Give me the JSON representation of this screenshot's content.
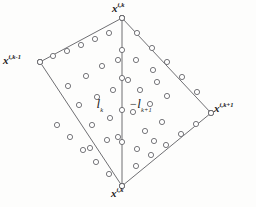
{
  "figure": {
    "kind": "geometric-diagram",
    "background_color": "#fdfdfc",
    "stroke_color": "#5f5f63",
    "node_fill_color": "#ffffff",
    "text_color": "#1b1b1b",
    "width": 256,
    "height": 207
  },
  "vertices": {
    "top": {
      "base": "x",
      "superscript": "i,k",
      "x": 122,
      "y": 18
    },
    "left": {
      "base": "x",
      "superscript": "i,k-1",
      "x": 40,
      "y": 62
    },
    "right": {
      "base": "x",
      "superscript": "i,k+1",
      "x": 211,
      "y": 113
    },
    "bottom": {
      "base": "x",
      "superscript": "i,k",
      "x": 122,
      "y": 186
    }
  },
  "regions": {
    "left_region": {
      "sign": "",
      "base": "l",
      "subscript": "k",
      "x": 103,
      "y": 104
    },
    "right_region": {
      "sign": "−",
      "base": "l",
      "subscript": "k+1",
      "x": 146,
      "y": 104
    }
  },
  "edges": [
    {
      "name": "edge-left-to-top",
      "from": "left",
      "to": "top"
    },
    {
      "name": "edge-top-to-right",
      "from": "top",
      "to": "right"
    },
    {
      "name": "edge-right-to-bottom",
      "from": "right",
      "to": "bottom"
    },
    {
      "name": "edge-bottom-to-left",
      "from": "bottom",
      "to": "left"
    },
    {
      "name": "edge-median-top-bottom",
      "from": "top",
      "to": "bottom"
    }
  ],
  "edge_nodes": {
    "left_to_top": [
      [
        40,
        62
      ],
      [
        53,
        56
      ],
      [
        67,
        51
      ],
      [
        81,
        45
      ],
      [
        95,
        39
      ],
      [
        109,
        33
      ],
      [
        122,
        18
      ]
    ],
    "top_to_right": [
      [
        122,
        18
      ],
      [
        137,
        33
      ],
      [
        152,
        48
      ],
      [
        167,
        62
      ],
      [
        182,
        77
      ],
      [
        197,
        92
      ],
      [
        211,
        113
      ]
    ],
    "right_to_bottom": [
      [
        211,
        113
      ],
      [
        196,
        124
      ],
      [
        181,
        134
      ],
      [
        166,
        145
      ],
      [
        151,
        155
      ],
      [
        136,
        166
      ],
      [
        122,
        186
      ]
    ],
    "bottom_to_left": [
      [
        122,
        186
      ],
      [
        109,
        174
      ],
      [
        96,
        162
      ],
      [
        83,
        150
      ],
      [
        70,
        137
      ],
      [
        57,
        125
      ],
      [
        40,
        62
      ]
    ],
    "median": [
      [
        122,
        18
      ],
      [
        122,
        50
      ],
      [
        122,
        78
      ],
      [
        122,
        110
      ],
      [
        122,
        142
      ],
      [
        122,
        186
      ]
    ]
  },
  "interior_nodes": [
    [
      68,
      86
    ],
    [
      86,
      76
    ],
    [
      102,
      66
    ],
    [
      118,
      60
    ],
    [
      79,
      105
    ],
    [
      97,
      97
    ],
    [
      113,
      90
    ],
    [
      92,
      125
    ],
    [
      110,
      118
    ],
    [
      136,
      60
    ],
    [
      153,
      70
    ],
    [
      140,
      90
    ],
    [
      157,
      82
    ],
    [
      133,
      112
    ],
    [
      150,
      104
    ],
    [
      167,
      96
    ],
    [
      145,
      131
    ],
    [
      162,
      122
    ],
    [
      90,
      148
    ],
    [
      107,
      140
    ],
    [
      137,
      149
    ],
    [
      154,
      141
    ],
    [
      118,
      137
    ],
    [
      128,
      80
    ]
  ],
  "node_radius": 2.6
}
